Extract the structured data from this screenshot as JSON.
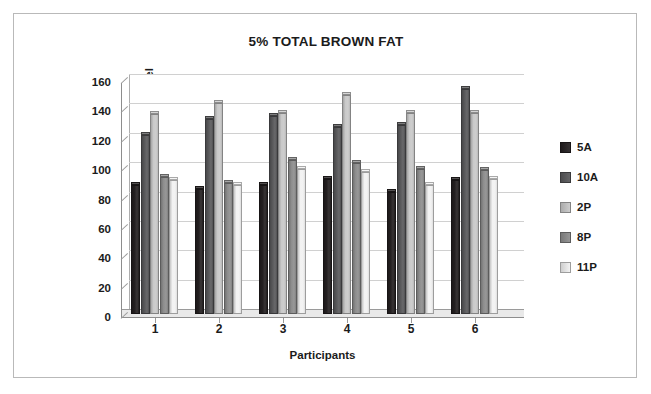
{
  "chart_data": {
    "type": "bar",
    "title": "5% TOTAL BROWN FAT",
    "xlabel": "Participants",
    "ylabel": "Blood Glucose Level",
    "categories": [
      "1",
      "2",
      "3",
      "4",
      "5",
      "6"
    ],
    "series": [
      {
        "name": "5A",
        "color": "#231f20",
        "values": [
          88,
          85,
          88,
          92,
          83,
          91
        ]
      },
      {
        "name": "10A",
        "color": "#58585a",
        "values": [
          122,
          133,
          135,
          127,
          129,
          153
        ]
      },
      {
        "name": "2P",
        "color": "#c9c9c9",
        "values": [
          136,
          144,
          137,
          149,
          137,
          137
        ]
      },
      {
        "name": "8P",
        "color": "#8d8d8d",
        "values": [
          93,
          89,
          105,
          103,
          99,
          98
        ]
      },
      {
        "name": "11P",
        "color": "#f2f2f2",
        "values": [
          91,
          88,
          99,
          97,
          88,
          92
        ]
      }
    ],
    "ylim": [
      0,
      160
    ],
    "ytick_labels": [
      "160",
      "140",
      "120",
      "100",
      "80",
      "60",
      "40",
      "20",
      "0"
    ],
    "ytick_values": [
      160,
      140,
      120,
      100,
      80,
      60,
      40,
      20,
      0
    ],
    "grid": true,
    "legend_position": "right"
  }
}
